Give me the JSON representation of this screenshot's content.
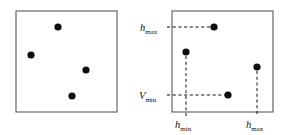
{
  "figure": {
    "background_color": "#ffffff",
    "frame_color": "#555a5e",
    "point_color": "#0d0d0d",
    "guide_color": "#111111",
    "point_radius": 3.6,
    "panels": [
      {
        "id": "left-panel",
        "name": "unannotated-point-set-panel",
        "frame": {
          "x": 16,
          "y": 11,
          "width": 101,
          "height": 101
        },
        "points": [
          {
            "id": "p1",
            "label": "point-top",
            "x": 58,
            "y": 27
          },
          {
            "id": "p2",
            "label": "point-left",
            "x": 31,
            "y": 55
          },
          {
            "id": "p3",
            "label": "point-right",
            "x": 86,
            "y": 70
          },
          {
            "id": "p4",
            "label": "point-bottom",
            "x": 72,
            "y": 96
          }
        ],
        "guides": [],
        "labels": []
      },
      {
        "id": "right-panel",
        "name": "annotated-point-set-panel",
        "frame": {
          "x": 172,
          "y": 11,
          "width": 101,
          "height": 101
        },
        "points": [
          {
            "id": "q1",
            "label": "point-top",
            "x": 214,
            "y": 27
          },
          {
            "id": "q2",
            "label": "point-left",
            "x": 186,
            "y": 52
          },
          {
            "id": "q3",
            "label": "point-right",
            "x": 257,
            "y": 67
          },
          {
            "id": "q4",
            "label": "point-bottom",
            "x": 228,
            "y": 95
          }
        ],
        "guides": [
          {
            "id": "g1",
            "name": "hmax-horizontal-guide",
            "orientation": "horizontal",
            "x1": 167,
            "y1": 27,
            "x2": 211,
            "y2": 27
          },
          {
            "id": "g2",
            "name": "vmin-horizontal-guide",
            "orientation": "horizontal",
            "x1": 167,
            "y1": 95,
            "x2": 225,
            "y2": 95
          },
          {
            "id": "g3",
            "name": "hmin-vertical-guide",
            "orientation": "vertical",
            "x1": 186,
            "y1": 56,
            "x2": 186,
            "y2": 116
          },
          {
            "id": "g4",
            "name": "hmax-vertical-guide",
            "orientation": "vertical",
            "x1": 257,
            "y1": 71,
            "x2": 257,
            "y2": 116
          }
        ],
        "labels": [
          {
            "id": "l1",
            "name": "axis-label-hmax-left",
            "base": "h",
            "sub": "max",
            "x": 140,
            "y": 31,
            "anchor": "start"
          },
          {
            "id": "l2",
            "name": "axis-label-vmin-left",
            "base": "V",
            "sub": "min",
            "x": 139,
            "y": 99,
            "anchor": "start"
          },
          {
            "id": "l3",
            "name": "axis-label-hmin-bottom",
            "base": "h",
            "sub": "min",
            "x": 175,
            "y": 128,
            "anchor": "start"
          },
          {
            "id": "l4",
            "name": "axis-label-hmax-bottom",
            "base": "h",
            "sub": "max",
            "x": 246,
            "y": 128,
            "anchor": "start"
          }
        ]
      }
    ]
  },
  "chart_data": {
    "type": "scatter",
    "xlabel": "",
    "ylabel": "",
    "grid": false,
    "legend": null,
    "panel_count": 2,
    "series": [
      {
        "name": "left panel points (unannotated)",
        "points": [
          {
            "x": 58,
            "y": 27
          },
          {
            "x": 31,
            "y": 55
          },
          {
            "x": 86,
            "y": 70
          },
          {
            "x": 72,
            "y": 96
          }
        ]
      },
      {
        "name": "right panel points (annotated)",
        "points": [
          {
            "x": 214,
            "y": 27
          },
          {
            "x": 186,
            "y": 52
          },
          {
            "x": 257,
            "y": 67
          },
          {
            "x": 228,
            "y": 95
          }
        ]
      }
    ],
    "annotations": [
      {
        "text": "h max",
        "role": "y-axis tick label",
        "position": "left of right panel, top"
      },
      {
        "text": "V min",
        "role": "y-axis tick label",
        "position": "left of right panel, bottom"
      },
      {
        "text": "h min",
        "role": "x-axis tick label",
        "position": "below right panel, left"
      },
      {
        "text": "h max",
        "role": "x-axis tick label",
        "position": "below right panel, right"
      }
    ]
  }
}
